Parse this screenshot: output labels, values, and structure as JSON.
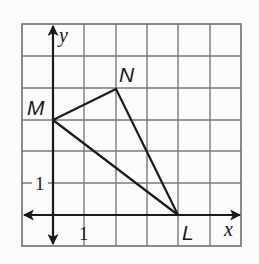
{
  "diagram": {
    "type": "coordinate-plane-triangle",
    "grid": {
      "columns": 7,
      "rows": 7,
      "x_range": [
        -1,
        6
      ],
      "y_range": [
        -1,
        6
      ],
      "unit": 1
    },
    "axes": {
      "x_label": "x",
      "y_label": "y"
    },
    "tick_labels": {
      "x_tick": "1",
      "y_tick": "1"
    },
    "vertices": [
      {
        "name": "M",
        "x": 0,
        "y": 3
      },
      {
        "name": "N",
        "x": 2,
        "y": 4
      },
      {
        "name": "L",
        "x": 4,
        "y": 0
      }
    ],
    "edges": [
      [
        "M",
        "N"
      ],
      [
        "N",
        "L"
      ],
      [
        "L",
        "M"
      ]
    ],
    "colors": {
      "grid": "#7a7a7a",
      "axis": "#1a1a1a",
      "triangle": "#1c1c1c",
      "background": "#fbfbfb"
    }
  }
}
